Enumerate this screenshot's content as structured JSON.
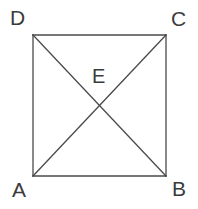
{
  "figure": {
    "kind": "geometry-diagram",
    "background_color": "#ffffff",
    "stroke_color": "#4a4a4a",
    "label_color": "#3b3b3b",
    "stroke_width": 1.3,
    "square": {
      "name": "square-ABCD",
      "left": 33,
      "top": 35,
      "right": 166,
      "bottom": 176
    },
    "vertices": [
      {
        "id": "D",
        "label": "D",
        "x": 33,
        "y": 35,
        "label_x": 10,
        "label_y": 7
      },
      {
        "id": "C",
        "label": "C",
        "x": 166,
        "y": 35,
        "label_x": 171,
        "label_y": 8
      },
      {
        "id": "A",
        "label": "A",
        "x": 33,
        "y": 176,
        "label_x": 12,
        "label_y": 179
      },
      {
        "id": "B",
        "label": "B",
        "x": 166,
        "y": 176,
        "label_x": 172,
        "label_y": 178
      }
    ],
    "intersection": {
      "id": "E",
      "label": "E",
      "x": 99.5,
      "y": 105.5,
      "label_x": 92,
      "label_y": 66
    },
    "edges": [
      {
        "name": "side-DC",
        "from": "D",
        "to": "C"
      },
      {
        "name": "side-CB",
        "from": "C",
        "to": "B"
      },
      {
        "name": "side-BA",
        "from": "B",
        "to": "A"
      },
      {
        "name": "side-AD",
        "from": "A",
        "to": "D"
      },
      {
        "name": "diagonal-DB",
        "from": "D",
        "to": "B"
      },
      {
        "name": "diagonal-AC",
        "from": "A",
        "to": "C"
      }
    ]
  }
}
